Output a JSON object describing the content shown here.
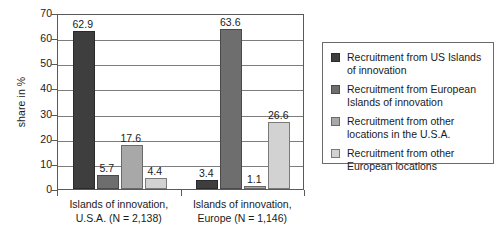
{
  "chart_data": {
    "type": "bar",
    "title": "",
    "xlabel": "",
    "ylabel": "share in %",
    "ylim": [
      0,
      70
    ],
    "yticks": [
      0,
      10,
      20,
      30,
      40,
      50,
      60,
      70
    ],
    "ytick_labels": [
      "0",
      "10",
      "20",
      "30",
      "40",
      "50",
      "60",
      "70"
    ],
    "grid": true,
    "legend_position": "right",
    "categories": [
      "Islands of innovation,\nU.S.A. (N = 2,138)",
      "Islands of innovation,\nEurope (N = 1,146)"
    ],
    "category_labels": [
      {
        "line1": "Islands of innovation,",
        "line2": "U.S.A. (N = 2,138)"
      },
      {
        "line1": "Islands of innovation,",
        "line2": "Europe (N = 1,146)"
      }
    ],
    "series": [
      {
        "name": "Recruitment from US Islands of innovation",
        "legend_line1": "Recruitment from US Islands",
        "legend_line2": "of innovation",
        "color": "#3e3e3e",
        "values": [
          62.9,
          3.4
        ],
        "value_labels": [
          "62.9",
          "3.4"
        ]
      },
      {
        "name": "Recruitment from European Islands of innovation",
        "legend_line1": "Recruitment from European",
        "legend_line2": "Islands of innovation",
        "color": "#6e6e6e",
        "values": [
          5.7,
          63.6
        ],
        "value_labels": [
          "5.7",
          "63.6"
        ]
      },
      {
        "name": "Recruitment from other locations in the U.S.A.",
        "legend_line1": "Recruitment from other",
        "legend_line2": "locations in the U.S.A.",
        "color": "#a8a8a8",
        "values": [
          17.6,
          1.1
        ],
        "value_labels": [
          "17.6",
          "1.1"
        ]
      },
      {
        "name": "Recruitment from other European locations",
        "legend_line1": "Recruitment from other",
        "legend_line2": "European locations",
        "color": "#d2d2d2",
        "values": [
          4.4,
          26.6
        ],
        "value_labels": [
          "4.4",
          "26.6"
        ]
      }
    ]
  }
}
